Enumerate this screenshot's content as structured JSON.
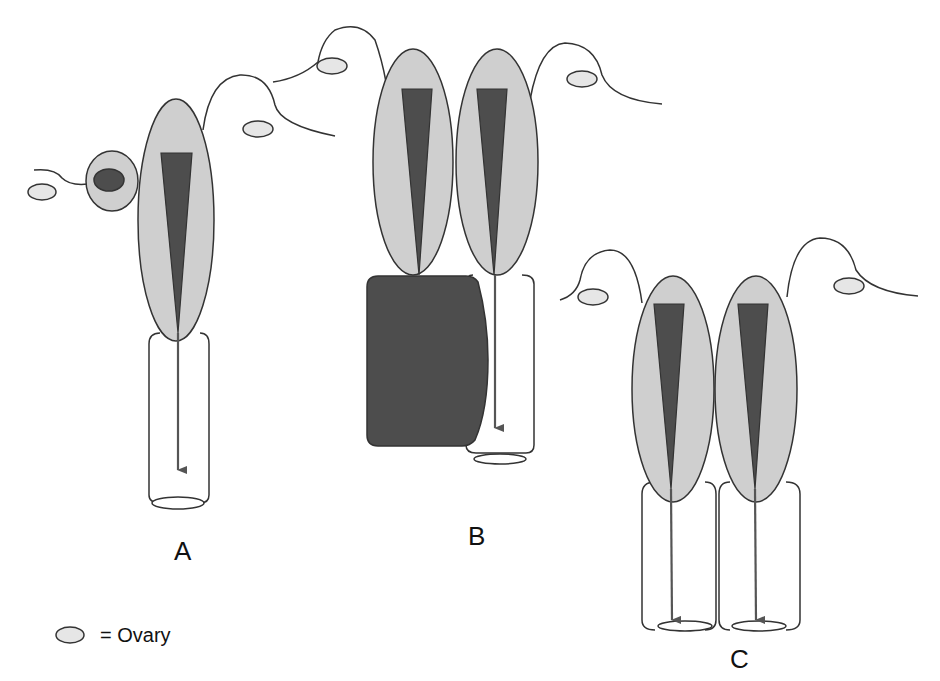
{
  "diagram": {
    "panels": [
      {
        "id": "A",
        "label": "A"
      },
      {
        "id": "B",
        "label": "B"
      },
      {
        "id": "C",
        "label": "C"
      }
    ],
    "legend": {
      "symbol": "ovary-ellipse",
      "text": "= Ovary"
    },
    "colors": {
      "light_fill": "#cfcfcf",
      "dark_fill": "#4d4d4d",
      "ovary_fill": "#e6e6e6",
      "stroke": "#333333",
      "arrow": "#555555",
      "background": "#ffffff"
    }
  }
}
